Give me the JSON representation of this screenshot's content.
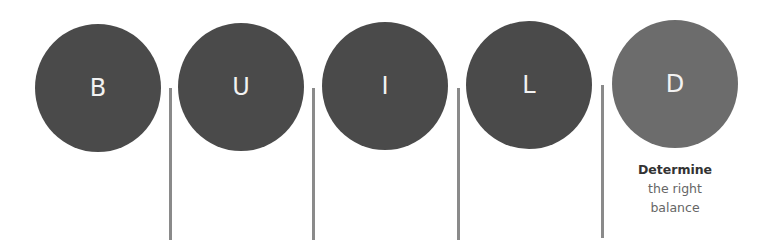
{
  "diagram": {
    "steps": [
      {
        "letter": "B"
      },
      {
        "letter": "U"
      },
      {
        "letter": "I"
      },
      {
        "letter": "L"
      },
      {
        "letter": "D",
        "highlighted": true,
        "caption_bold": "Determine",
        "caption_line1": "the right",
        "caption_line2": "balance"
      }
    ],
    "colors": {
      "circle": "#4a4a4a",
      "highlight_circle": "#6c6c6c",
      "divider": "#8a8a8a"
    }
  }
}
